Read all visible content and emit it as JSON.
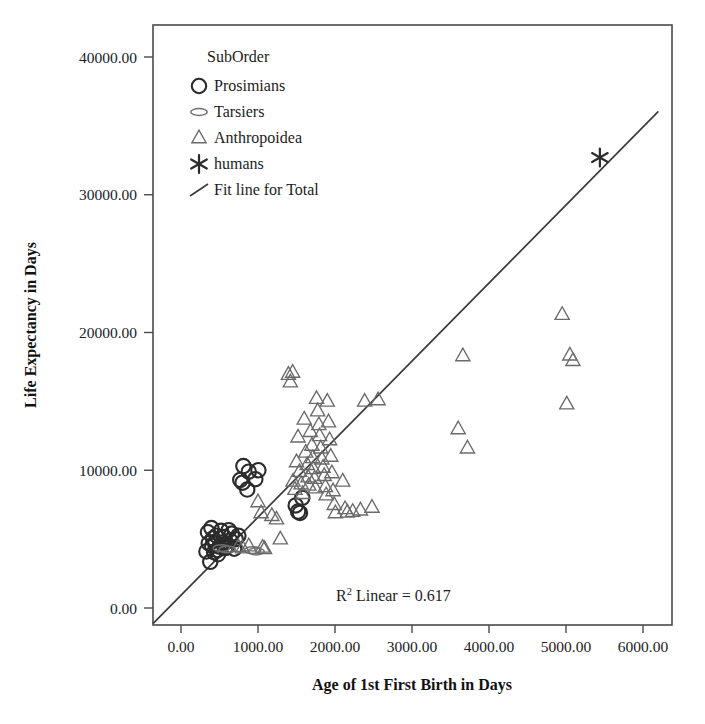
{
  "chart_data": {
    "type": "scatter",
    "title": "",
    "xlabel": "Age of 1st First Birth in Days",
    "ylabel": "Life Expectancy in Days",
    "xlim": [
      0,
      6000
    ],
    "ylim": [
      0,
      40000
    ],
    "xticks": [
      "0.00",
      "1000.00",
      "2000.00",
      "3000.00",
      "4000.00",
      "5000.00",
      "6000.00"
    ],
    "yticks": [
      "0.00",
      "10000.00",
      "20000.00",
      "30000.00",
      "40000.00"
    ],
    "xtick_values": [
      0,
      1000,
      2000,
      3000,
      4000,
      5000,
      6000
    ],
    "ytick_values": [
      0,
      10000,
      20000,
      30000,
      40000
    ],
    "grid": false,
    "legend_position": "top-left",
    "legend_title": "SubOrder",
    "annotations": [
      {
        "text": "R² Linear = 0.617",
        "text_main": "R",
        "text_sup": "2",
        "text_rest": " Linear = 0.617",
        "x": 2450,
        "y": 1500
      }
    ],
    "fit_line": {
      "name": "Fit line for Total",
      "x_start": -420,
      "y_start": -1450,
      "x_end": 6200,
      "y_end": 36050,
      "r_squared": 0.617
    },
    "series": [
      {
        "name": "Prosimians",
        "marker": "circle",
        "color": "#2b2b2b",
        "points": [
          [
            330,
            4100
          ],
          [
            350,
            5500
          ],
          [
            360,
            4700
          ],
          [
            380,
            3350
          ],
          [
            395,
            5800
          ],
          [
            405,
            4500
          ],
          [
            415,
            5050
          ],
          [
            430,
            4050
          ],
          [
            445,
            4650
          ],
          [
            460,
            5250
          ],
          [
            470,
            4200
          ],
          [
            480,
            3900
          ],
          [
            500,
            4450
          ],
          [
            520,
            5600
          ],
          [
            540,
            4750
          ],
          [
            560,
            5150
          ],
          [
            575,
            4350
          ],
          [
            600,
            4500
          ],
          [
            620,
            5650
          ],
          [
            640,
            4900
          ],
          [
            660,
            5400
          ],
          [
            690,
            4300
          ],
          [
            710,
            5000
          ],
          [
            745,
            5250
          ],
          [
            770,
            9300
          ],
          [
            800,
            9100
          ],
          [
            810,
            10300
          ],
          [
            860,
            8600
          ],
          [
            880,
            9900
          ],
          [
            965,
            9350
          ],
          [
            1005,
            10000
          ],
          [
            1490,
            7450
          ],
          [
            1520,
            7000
          ],
          [
            1545,
            6900
          ],
          [
            1575,
            8000
          ]
        ]
      },
      {
        "name": "Tarsiers",
        "marker": "ellipse",
        "color": "#6f6f6f",
        "points": [
          [
            525,
            4350
          ],
          [
            600,
            4250
          ],
          [
            930,
            4200
          ],
          [
            975,
            4100
          ]
        ]
      },
      {
        "name": "Anthropoidea",
        "marker": "triangle",
        "color": "#6a6a6a",
        "points": [
          [
            745,
            4450
          ],
          [
            800,
            4350
          ],
          [
            880,
            4500
          ],
          [
            1000,
            7700
          ],
          [
            1040,
            6900
          ],
          [
            1060,
            4400
          ],
          [
            1085,
            4300
          ],
          [
            1180,
            6700
          ],
          [
            1240,
            6450
          ],
          [
            1290,
            5000
          ],
          [
            1395,
            16950
          ],
          [
            1420,
            16400
          ],
          [
            1450,
            17100
          ],
          [
            1455,
            9200
          ],
          [
            1480,
            8600
          ],
          [
            1500,
            10600
          ],
          [
            1520,
            12400
          ],
          [
            1540,
            9900
          ],
          [
            1560,
            9000
          ],
          [
            1580,
            8300
          ],
          [
            1600,
            13700
          ],
          [
            1620,
            11300
          ],
          [
            1640,
            10400
          ],
          [
            1650,
            9500
          ],
          [
            1660,
            8900
          ],
          [
            1680,
            12800
          ],
          [
            1700,
            11800
          ],
          [
            1710,
            10900
          ],
          [
            1720,
            10100
          ],
          [
            1735,
            9400
          ],
          [
            1745,
            8700
          ],
          [
            1760,
            15200
          ],
          [
            1775,
            14300
          ],
          [
            1790,
            13300
          ],
          [
            1800,
            12500
          ],
          [
            1815,
            11600
          ],
          [
            1830,
            10800
          ],
          [
            1845,
            10200
          ],
          [
            1860,
            9600
          ],
          [
            1875,
            8800
          ],
          [
            1885,
            8200
          ],
          [
            1900,
            15000
          ],
          [
            1915,
            13500
          ],
          [
            1930,
            12200
          ],
          [
            1945,
            11000
          ],
          [
            1960,
            9800
          ],
          [
            1975,
            8500
          ],
          [
            1990,
            7500
          ],
          [
            2005,
            6900
          ],
          [
            2100,
            9200
          ],
          [
            2130,
            7200
          ],
          [
            2160,
            6950
          ],
          [
            2230,
            7000
          ],
          [
            2330,
            7100
          ],
          [
            2385,
            15000
          ],
          [
            2480,
            7300
          ],
          [
            2560,
            15100
          ],
          [
            3600,
            13000
          ],
          [
            3720,
            11600
          ],
          [
            3660,
            18300
          ],
          [
            4950,
            21300
          ],
          [
            5050,
            18350
          ],
          [
            5090,
            17950
          ],
          [
            5010,
            14800
          ]
        ]
      },
      {
        "name": "humans",
        "marker": "asterisk",
        "color": "#2b2b2b",
        "points": [
          [
            5440,
            32700
          ]
        ]
      }
    ],
    "legend_entries": [
      {
        "label": "Prosimians",
        "marker": "circle"
      },
      {
        "label": "Tarsiers",
        "marker": "ellipse"
      },
      {
        "label": "Anthropoidea",
        "marker": "triangle"
      },
      {
        "label": "humans",
        "marker": "asterisk"
      },
      {
        "label": "Fit line for Total",
        "marker": "line"
      }
    ]
  }
}
